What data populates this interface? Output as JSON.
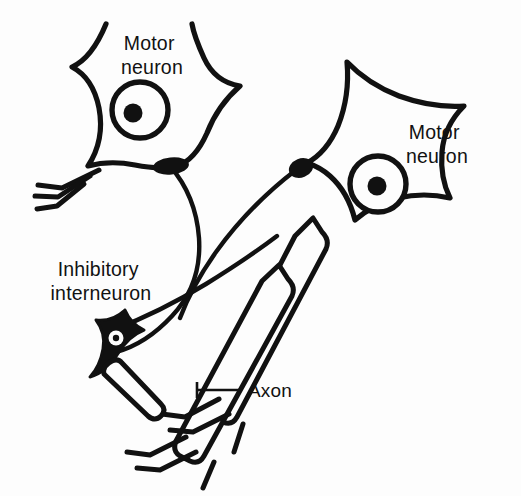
{
  "figure": {
    "background_color": "#fdfdfd",
    "ink_color": "#111111",
    "style": "black-and-white line drawing"
  },
  "labels": {
    "motor_neuron_left": {
      "line1": "Motor",
      "line2": "neuron"
    },
    "motor_neuron_right": {
      "line1": "Motor",
      "line2": "neuron"
    },
    "inhibitory_interneuron": {
      "line1": "Inhibitory",
      "line2": "interneuron"
    },
    "axon": {
      "text": "Axon"
    }
  },
  "elements": {
    "left_motor_neuron": {
      "name": "Motor neuron",
      "soma_fill": "#fdfdfd",
      "outline": "#111111",
      "nucleus": "ring with nucleolus",
      "dendrite_count": 3
    },
    "right_motor_neuron": {
      "name": "Motor neuron",
      "soma_fill": "#fdfdfd",
      "outline": "#111111",
      "nucleus": "ring with nucleolus"
    },
    "inhibitory_interneuron": {
      "name": "Inhibitory interneuron",
      "soma_fill": "#111111",
      "nucleus": "white ring with black center"
    },
    "axons": {
      "name": "Axon",
      "count": 2,
      "style": "myelinated tube"
    },
    "synaptic_boutons": {
      "count": 2,
      "fill": "#111111"
    }
  }
}
